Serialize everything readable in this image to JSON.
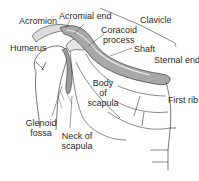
{
  "diagram": {
    "labels": {
      "acromion": "Acromion",
      "acromial_end": "Acromial end",
      "clavicle": "Clavicle",
      "coracoid_process_line1": "Coracoid",
      "coracoid_process_line2": "process",
      "shaft": "Shaft",
      "sternal_end": "Sternal end",
      "humerus": "Humerus",
      "body_of_scapula_line1": "Body",
      "body_of_scapula_line2": "of",
      "body_of_scapula_line3": "scapula",
      "first_rib": "First rib",
      "glenoid_fossa_line1": "Glenoid",
      "glenoid_fossa_line2": "fossa",
      "neck_of_scapula_line1": "Neck of",
      "neck_of_scapula_line2": "scapula"
    },
    "colors": {
      "line": "#3a3a3a",
      "bone_shade": "#9a9a9a",
      "bone_fill": "#c8c8c8",
      "text": "#2a2a2a",
      "background": "#ffffff"
    }
  }
}
